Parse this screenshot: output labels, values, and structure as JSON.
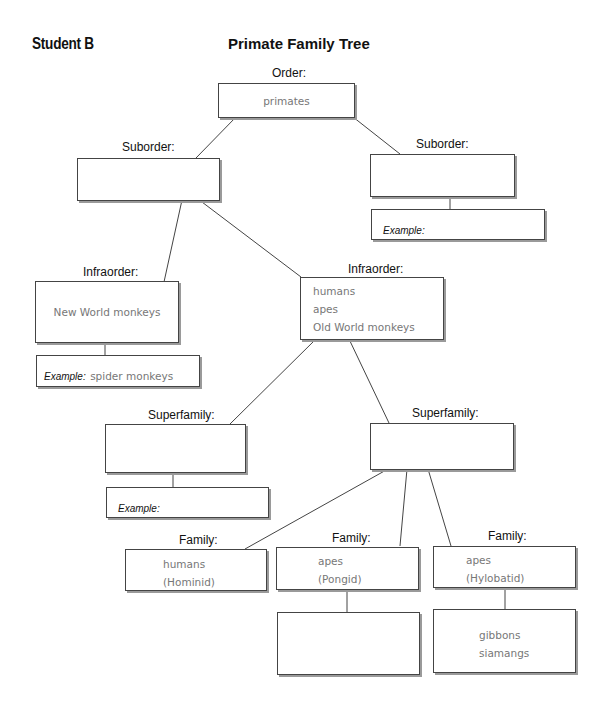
{
  "header": {
    "student_label": "Student B",
    "title": "Primate Family Tree"
  },
  "tree": {
    "order": {
      "label": "Order:",
      "value": "primates"
    },
    "suborder_left": {
      "label": "Suborder:",
      "value": ""
    },
    "suborder_right": {
      "label": "Suborder:",
      "value": "",
      "example_label": "Example:",
      "example_value": ""
    },
    "infraorder_left": {
      "label": "Infraorder:",
      "value": "New World monkeys",
      "example_label": "Example:",
      "example_value": "spider monkeys"
    },
    "infraorder_right": {
      "label": "Infraorder:",
      "values": [
        "humans",
        "apes",
        "Old World monkeys"
      ]
    },
    "superfamily_left": {
      "label": "Superfamily:",
      "value": "",
      "example_label": "Example:",
      "example_value": ""
    },
    "superfamily_right": {
      "label": "Superfamily:",
      "value": ""
    },
    "family_1": {
      "label": "Family:",
      "values": [
        "humans",
        "(Hominid)"
      ]
    },
    "family_2": {
      "label": "Family:",
      "values": [
        "apes",
        "(Pongid)"
      ],
      "child_values": []
    },
    "family_3": {
      "label": "Family:",
      "values": [
        "apes",
        "(Hylobatid)"
      ],
      "child_values": [
        "gibbons",
        "siamangs"
      ]
    }
  }
}
